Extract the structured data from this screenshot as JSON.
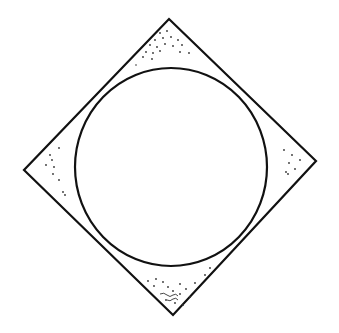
{
  "figure": {
    "background": "#ffffff",
    "stroke_color": "#111111",
    "shapes": {
      "diamond": {
        "top": [
          169,
          19
        ],
        "right": [
          316,
          161
        ],
        "bottom": [
          173,
          315
        ],
        "left": [
          24,
          170
        ]
      },
      "circle": {
        "cx": 171,
        "cy": 167,
        "rx": 96,
        "ry": 99
      }
    }
  }
}
